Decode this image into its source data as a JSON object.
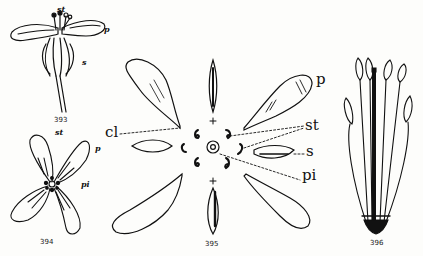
{
  "figures": [
    {
      "number": "393",
      "description": "Side view of flower",
      "labels": {
        "stamens": "st",
        "petal": "p",
        "sepal": "s"
      }
    },
    {
      "number": "394",
      "description": "Top view of four-petaled flower",
      "labels": {
        "stamens": "st",
        "petal": "p",
        "pistil": "pi"
      }
    },
    {
      "number": "395",
      "description": "Exploded floral diagram",
      "labels": {
        "claw": "cl",
        "petal": "p",
        "stamens": "st",
        "sepal": "s",
        "pistil": "pi",
        "plus_top": "+",
        "plus_bottom": "+"
      }
    },
    {
      "number": "396",
      "description": "Stamens and pistil with petals removed",
      "labels": {}
    }
  ],
  "colors": {
    "ink": "#111111",
    "paper": "#fdfdfb"
  }
}
